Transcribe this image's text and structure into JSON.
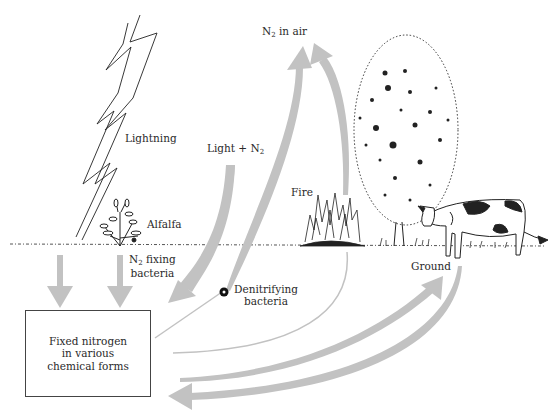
{
  "diagram": {
    "labels": {
      "n2_in_air": {
        "main": "N",
        "sub": "2",
        "rest": " in air"
      },
      "lightning": "Lightning",
      "light_n2": {
        "main": "Light + N",
        "sub": "2"
      },
      "alfalfa": "Alfalfa",
      "fire": "Fire",
      "n2_fixing": {
        "main": "N",
        "sub": "2",
        "rest": " fixing",
        "line2": "bacteria"
      },
      "denitrifying": {
        "line1": "Denitrifying",
        "line2": "bacteria"
      },
      "ground": "Ground",
      "fixed_nitrogen_box": "Fixed nitrogen\nin various\nchemical forms"
    },
    "illustrations": [
      "lightning-bolt",
      "alfalfa-plant",
      "fire",
      "tree",
      "cow",
      "ground-line",
      "bacteria-dot"
    ],
    "arrows": [
      {
        "from": "lightning",
        "to": "fixed-nitrogen",
        "style": "thick-down"
      },
      {
        "from": "n2-fixing-bacteria",
        "to": "fixed-nitrogen",
        "style": "thick-down"
      },
      {
        "from": "light-n2",
        "to": "fixed-nitrogen",
        "style": "thick-curved"
      },
      {
        "from": "denitrifying-bacteria",
        "to": "n2-in-air",
        "style": "thick-curved"
      },
      {
        "from": "fire",
        "to": "n2-in-air",
        "style": "thick-curved"
      },
      {
        "from": "fire",
        "to": "fixed-nitrogen",
        "style": "thin-curved"
      },
      {
        "from": "fixed-nitrogen",
        "to": "denitrifying-bacteria",
        "style": "thin-line"
      },
      {
        "from": "fixed-nitrogen",
        "to": "ground",
        "style": "thick-curved"
      },
      {
        "from": "ground",
        "to": "fixed-nitrogen",
        "style": "thick-curved"
      }
    ],
    "colors": {
      "arrow": "#c2c2c2",
      "ink": "#222222",
      "background": "#ffffff"
    }
  }
}
